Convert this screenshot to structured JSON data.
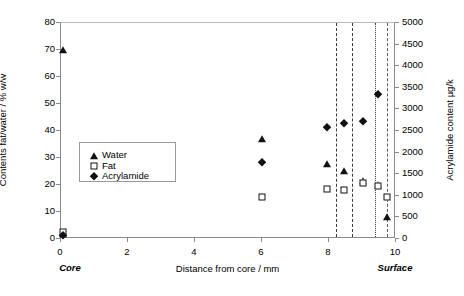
{
  "chart_data": {
    "type": "scatter",
    "title": "",
    "xlabel": "Distance from core / mm",
    "ylabel": "Contents fat/water / % w/w",
    "y2label": "Acrylamide content µg/k",
    "xlim": [
      0,
      10
    ],
    "ylim": [
      0,
      80
    ],
    "y2lim": [
      0,
      5000
    ],
    "xticks": [
      "0",
      "2",
      "4",
      "6",
      "8",
      "10"
    ],
    "xtick_values": [
      0,
      2,
      4,
      6,
      8,
      10
    ],
    "yticks": [
      "0",
      "10",
      "20",
      "30",
      "40",
      "50",
      "60",
      "70",
      "80"
    ],
    "ytick_values": [
      0,
      10,
      20,
      30,
      40,
      50,
      60,
      70,
      80
    ],
    "y2ticks": [
      "0",
      "500",
      "1000",
      "1500",
      "2000",
      "2500",
      "3000",
      "3500",
      "4000",
      "4500",
      "5000"
    ],
    "y2tick_values": [
      0,
      500,
      1000,
      1500,
      2000,
      2500,
      3000,
      3500,
      4000,
      4500,
      5000
    ],
    "grid": false,
    "legend_position": "center-left",
    "axis_annotations": {
      "left_end": "Core",
      "right_end": "Surface"
    },
    "series": [
      {
        "name": "Water",
        "marker": "filled-triangle",
        "axis": "left",
        "color": "#111111",
        "points": [
          {
            "x": 0.05,
            "y": 70.5
          },
          {
            "x": 0.05,
            "y": 2.2
          },
          {
            "x": 6.0,
            "y": 37.5
          },
          {
            "x": 7.95,
            "y": 28.3
          },
          {
            "x": 8.45,
            "y": 25.4
          },
          {
            "x": 9.0,
            "y": 21.8
          },
          {
            "x": 9.45,
            "y": 20.4
          },
          {
            "x": 9.72,
            "y": 8.4
          }
        ]
      },
      {
        "name": "Fat",
        "marker": "open-square",
        "axis": "left",
        "color": "#111111",
        "points": [
          {
            "x": 0.05,
            "y": 2.6
          },
          {
            "x": 6.0,
            "y": 15.5
          },
          {
            "x": 7.95,
            "y": 18.4
          },
          {
            "x": 8.45,
            "y": 18.0
          },
          {
            "x": 9.0,
            "y": 20.8
          },
          {
            "x": 9.45,
            "y": 19.8
          },
          {
            "x": 9.72,
            "y": 15.5
          }
        ]
      },
      {
        "name": "Acrylamide",
        "marker": "filled-diamond",
        "axis": "right",
        "color": "#111111",
        "points": [
          {
            "x": 0.05,
            "y": 100
          },
          {
            "x": 6.0,
            "y": 1790
          },
          {
            "x": 7.95,
            "y": 2600
          },
          {
            "x": 8.45,
            "y": 2690
          },
          {
            "x": 9.0,
            "y": 2740
          },
          {
            "x": 9.45,
            "y": 3350
          }
        ]
      }
    ],
    "vertical_lines": [
      {
        "x": 8.2,
        "style": "dash-dot",
        "color": "#3a3a3a"
      },
      {
        "x": 8.68,
        "style": "dash-dot",
        "color": "#3a3a3a"
      },
      {
        "x": 9.38,
        "style": "dotted",
        "color": "#3a3a3a"
      },
      {
        "x": 9.74,
        "style": "dashed",
        "color": "#5a5a5a"
      }
    ]
  },
  "legend": {
    "items": [
      {
        "label": "Water",
        "marker": "filled-triangle"
      },
      {
        "label": "Fat",
        "marker": "open-square"
      },
      {
        "label": "Acrylamide",
        "marker": "filled-diamond"
      }
    ]
  }
}
